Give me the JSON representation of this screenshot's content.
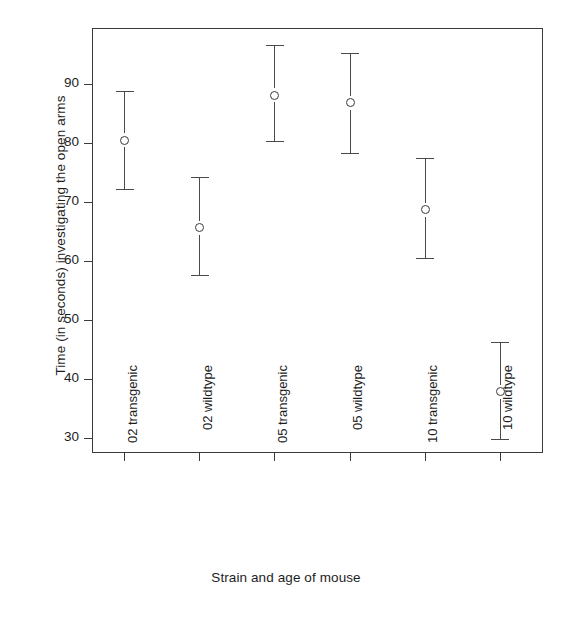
{
  "chart_data": {
    "type": "scatter",
    "title": "",
    "xlabel": "Strain and age of mouse",
    "ylabel": "Time (in seconds) investigating the open arms",
    "grid": false,
    "legend": "none",
    "ylim": [
      27.5,
      99.5
    ],
    "yticks": [
      30,
      40,
      50,
      60,
      70,
      80,
      90
    ],
    "ytick_labels": [
      "30",
      "40",
      "50",
      "60",
      "70",
      "80",
      "90"
    ],
    "categories": [
      "02 transgenic",
      "02 wildtype",
      "05 transgenic",
      "05 wildtype",
      "10 transgenic",
      "10 wildtype"
    ],
    "values": [
      80.5,
      65.7,
      88.1,
      86.8,
      68.7,
      37.9
    ],
    "error_low": [
      72.3,
      57.7,
      80.3,
      78.4,
      60.6,
      29.8
    ],
    "error_high": [
      88.8,
      74.2,
      96.6,
      95.3,
      77.4,
      46.3
    ],
    "marker": "open-circle",
    "marker_color": "#3b3b3b",
    "error_bar_color": "#4a4a4a",
    "axis_color": "#3b3b3b",
    "background": "#ffffff",
    "points": [
      {
        "category": "02 transgenic",
        "mean": 80.5,
        "lower": 72.3,
        "upper": 88.8
      },
      {
        "category": "02 wildtype",
        "mean": 65.7,
        "lower": 57.7,
        "upper": 74.2
      },
      {
        "category": "05 transgenic",
        "mean": 88.1,
        "lower": 80.3,
        "upper": 96.6
      },
      {
        "category": "05 wildtype",
        "mean": 86.8,
        "lower": 78.4,
        "upper": 95.3
      },
      {
        "category": "10 transgenic",
        "mean": 68.7,
        "lower": 60.6,
        "upper": 77.4
      },
      {
        "category": "10 wildtype",
        "mean": 37.9,
        "lower": 29.8,
        "upper": 46.3
      }
    ]
  }
}
